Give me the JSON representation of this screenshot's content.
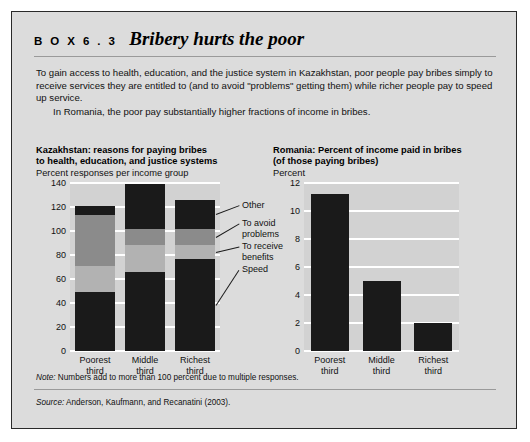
{
  "box": {
    "label": "B O X   6 . 3",
    "title": "Bribery hurts the poor",
    "paragraph1": "To gain access to health, education, and the justice system in Kazakhstan, poor people pay bribes simply to receive services they are entitled to (and to avoid \"problems\" getting them) while richer people pay to speed up service.",
    "paragraph2": "In Romania, the poor pay substantially higher fractions of income in bribes.",
    "note_label": "Note:",
    "note_text": " Numbers add to more than 100 percent due to multiple responses.",
    "source_label": "Source:",
    "source_text": " Anderson, Kaufmann, and Recanatini (2003)."
  },
  "colors": {
    "page_background": "#ffffff",
    "box_background": "#dcdcdc",
    "box_border": "#2a2a2a",
    "plot_background": "#d2d2d2",
    "gridline": "#ffffff",
    "speed": "#1a1a1a",
    "to_receive_benefits": "#b2b2b2",
    "to_avoid_problems": "#8b8b8b",
    "other": "#1a1a1a"
  },
  "chart_data": [
    {
      "type": "bar",
      "id": "kazakhstan",
      "title": "Kazakhstan: reasons for paying bribes\nto health, education, and justice systems",
      "title_line1": "Kazakhstan: reasons for paying bribes",
      "title_line2": "to health, education, and justice systems",
      "ylabel": "Percent responses per income group",
      "xlabel": "",
      "stacked": true,
      "grid": true,
      "legend_position": "right",
      "ylim": [
        0,
        140
      ],
      "yticks": [
        0,
        20,
        40,
        60,
        80,
        100,
        120,
        140
      ],
      "ytick_labels": [
        "0",
        "20",
        "40",
        "60",
        "80",
        "100",
        "120",
        "140"
      ],
      "categories": [
        "Poorest third",
        "Middle third",
        "Richest third"
      ],
      "category_lines": [
        [
          "Poorest",
          "third"
        ],
        [
          "Middle",
          "third"
        ],
        [
          "Richest",
          "third"
        ]
      ],
      "series": [
        {
          "name": "Speed",
          "color": "#1a1a1a",
          "values": [
            49,
            66,
            77
          ]
        },
        {
          "name": "To receive benefits",
          "color": "#b2b2b2",
          "values": [
            22,
            22,
            11
          ]
        },
        {
          "name": "To avoid problems",
          "color": "#8b8b8b",
          "values": [
            42,
            14,
            14
          ]
        },
        {
          "name": "Other",
          "color": "#1a1a1a",
          "values": [
            8,
            37,
            24
          ]
        }
      ],
      "totals": [
        121,
        139,
        126
      ]
    },
    {
      "type": "bar",
      "id": "romania",
      "title": "Romania: Percent of income paid in bribes\n(of those paying bribes)",
      "title_line1": "Romania: Percent of income paid in bribes",
      "title_line2": "(of those paying bribes)",
      "ylabel": "Percent",
      "xlabel": "",
      "stacked": false,
      "grid": true,
      "legend_position": "none",
      "ylim": [
        0,
        12
      ],
      "yticks": [
        0,
        2,
        4,
        6,
        8,
        10,
        12
      ],
      "ytick_labels": [
        "0",
        "2",
        "4",
        "6",
        "8",
        "10",
        "12"
      ],
      "categories": [
        "Poorest third",
        "Middle third",
        "Richest third"
      ],
      "category_lines": [
        [
          "Poorest",
          "third"
        ],
        [
          "Middle",
          "third"
        ],
        [
          "Richest",
          "third"
        ]
      ],
      "values": [
        11.2,
        5.0,
        2.0
      ],
      "bar_color": "#1a1a1a"
    }
  ]
}
